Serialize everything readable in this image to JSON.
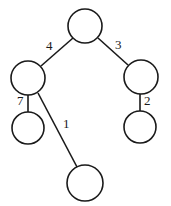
{
  "diagram": {
    "type": "tree",
    "nodes": [
      {
        "id": "root",
        "label": ""
      },
      {
        "id": "left",
        "label": ""
      },
      {
        "id": "right",
        "label": ""
      },
      {
        "id": "left-left",
        "label": ""
      },
      {
        "id": "left-right",
        "label": ""
      },
      {
        "id": "right-child",
        "label": ""
      }
    ],
    "edges": [
      {
        "from": "root",
        "to": "left",
        "weight": "4"
      },
      {
        "from": "root",
        "to": "right",
        "weight": "3"
      },
      {
        "from": "left",
        "to": "left-left",
        "weight": "7"
      },
      {
        "from": "left",
        "to": "left-right",
        "weight": "1"
      },
      {
        "from": "right",
        "to": "right-child",
        "weight": "2"
      }
    ],
    "colors": {
      "stroke": "#1a1a1a",
      "fill": "#ffffff"
    }
  }
}
